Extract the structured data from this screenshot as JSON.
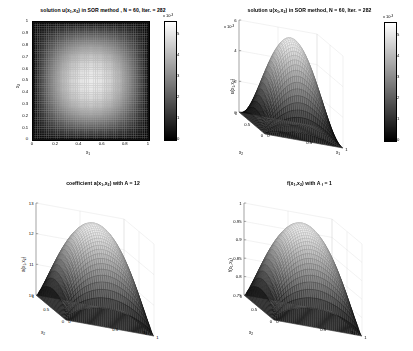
{
  "figure": {
    "background": "#ffffff",
    "colormap": "gray",
    "text_color": "#000000"
  },
  "chart_data": [
    {
      "id": "subplot-1",
      "type": "heatmap",
      "title": "solution u(x 1,x 2) in SOR  method ,  N = 60, Iter. = 282",
      "title_parts": {
        "pre": "solution u(x",
        "sub1": "1",
        "mid": ",x",
        "sub2": "2",
        "post": ") in SOR  method ,  N = 60, Iter. = 282"
      },
      "xlabel": "x",
      "xlabel_sub": "1",
      "ylabel": "x",
      "ylabel_sub": "2",
      "xlim": [
        0,
        1
      ],
      "ylim": [
        0,
        1
      ],
      "xticks": [
        "0",
        "0.2",
        "0.4",
        "0.6",
        "0.8",
        "1"
      ],
      "xtick_values": [
        0,
        0.2,
        0.4,
        0.6,
        0.8,
        1
      ],
      "yticks": [
        "0",
        "0.1",
        "0.2",
        "0.3",
        "0.4",
        "0.5",
        "0.6",
        "0.7",
        "0.8",
        "0.9",
        "1"
      ],
      "ytick_values": [
        0,
        0.1,
        0.2,
        0.3,
        0.4,
        0.5,
        0.6,
        0.7,
        0.8,
        0.9,
        1
      ],
      "grid": false,
      "colorbar": {
        "exponent_label": "x 10",
        "exponent_power": "-3",
        "ticks": [
          "0",
          "1",
          "2",
          "3",
          "4",
          "5"
        ],
        "tick_values": [
          0,
          1,
          2,
          3,
          4,
          5
        ],
        "clim": [
          0,
          5.6
        ],
        "position": "right"
      },
      "data_description": "u(x1,x2) = A_f*sin(pi*x1)*sin(pi*x2) scaled; peak ~5.6e-3 at center, zero on boundary",
      "peak_value": 0.0056,
      "grid_n": 60
    },
    {
      "id": "subplot-2",
      "type": "surface",
      "title": "solution u(x 1,x 2) in SOR method,  N = 60, Iter. = 282",
      "title_parts": {
        "pre": "solution u(x",
        "sub1": "1",
        "mid": ",x",
        "sub2": "2",
        "post": ") in SOR method,  N = 60, Iter. = 282"
      },
      "xlabel": "x",
      "xlabel_sub": "1",
      "ylabel": "x",
      "ylabel_sub": "2",
      "zlabel": "u(x",
      "zlabel_sub1": "1",
      "zlabel_mid": ",x",
      "zlabel_sub2": "2",
      "zlabel_post": ")",
      "xticks": [
        "0",
        "0.5",
        "1"
      ],
      "yticks": [
        "0",
        "0.5",
        "1"
      ],
      "zticks": [
        "0",
        "2",
        "4",
        "6"
      ],
      "ztick_values": [
        0,
        2,
        4,
        6
      ],
      "zlim": [
        0,
        6
      ],
      "z_exponent_label": "x 10",
      "z_exponent_power": "-3",
      "colorbar": {
        "exponent_label": "x 10",
        "exponent_power": "-3",
        "ticks": [
          "0",
          "1",
          "2",
          "3",
          "4",
          "5"
        ],
        "tick_values": [
          0,
          1,
          2,
          3,
          4,
          5
        ],
        "clim": [
          0,
          5.6
        ],
        "position": "right"
      },
      "peak_value": 0.0056,
      "grid_n": 60,
      "data_description": "bell-shaped sin(pi*x1)*sin(pi*x2) surface, peak ~5.6e-3"
    },
    {
      "id": "subplot-3",
      "type": "surface",
      "title": "coefficient a(x 1,x 2) with A = 12",
      "title_parts": {
        "pre": "coefficient a(x",
        "sub1": "1",
        "mid": ",x",
        "sub2": "2",
        "post": ") with A = 12"
      },
      "xlabel": "x",
      "xlabel_sub": "1",
      "ylabel": "x",
      "ylabel_sub": "2",
      "zlabel": "a(x",
      "zlabel_sub1": "1",
      "zlabel_mid": ",x",
      "zlabel_sub2": "2",
      "zlabel_post": ")",
      "xticks": [
        "0",
        "0.5",
        "1"
      ],
      "yticks": [
        "0",
        "0.5",
        "1"
      ],
      "zticks": [
        "10",
        "11",
        "12",
        "13"
      ],
      "ztick_values": [
        10,
        11,
        12,
        13
      ],
      "zlim": [
        10,
        13
      ],
      "amplitude_A": 12,
      "peak_value": 13,
      "min_value": 10,
      "grid_n": 60,
      "data_description": "a(x1,x2) = 10 + 3*sin(pi*x1)*sin(pi*x2) dome, base 10, peak ~13"
    },
    {
      "id": "subplot-4",
      "type": "surface",
      "title": "f(x 1,x 2) with A f = 1",
      "title_parts": {
        "pre": "f(x",
        "sub1": "1",
        "mid": ",x",
        "sub2": "2",
        "post": ") with A ",
        "sub3": "f",
        "post2": " = 1"
      },
      "xlabel": "x",
      "xlabel_sub": "1",
      "ylabel": "x",
      "ylabel_sub": "2",
      "zlabel": "f(x",
      "zlabel_sub1": "1",
      "zlabel_mid": ",x",
      "zlabel_sub2": "2",
      "zlabel_post": ")",
      "xticks": [
        "0",
        "0.5",
        "1"
      ],
      "yticks": [
        "0",
        "0.5",
        "1"
      ],
      "zticks": [
        "0.75",
        "0.8",
        "0.85",
        "0.9",
        "0.95",
        "1"
      ],
      "ztick_values": [
        0.75,
        0.8,
        0.85,
        0.9,
        0.95,
        1
      ],
      "zlim": [
        0.75,
        1
      ],
      "amplitude_Af": 1,
      "peak_value": 1,
      "min_value": 0.75,
      "grid_n": 60,
      "data_description": "f(x1,x2) = 0.75 + 0.25*sin(pi*x1)*sin(pi*x2) dome, base 0.75, peak 1"
    }
  ]
}
